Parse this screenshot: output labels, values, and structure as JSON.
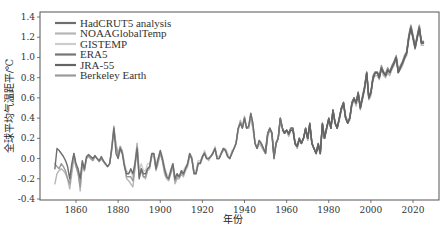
{
  "chart_data": {
    "type": "line",
    "title": "",
    "xlabel": "年份",
    "ylabel": "全球平均气温距平/℃",
    "xlim": [
      1843,
      2029
    ],
    "ylim": [
      -0.4,
      1.4
    ],
    "xticks": [
      1860,
      1880,
      1900,
      1920,
      1940,
      1960,
      1980,
      2000,
      2020
    ],
    "yticks": [
      -0.4,
      -0.2,
      0.0,
      0.2,
      0.4,
      0.6,
      0.8,
      1.0,
      1.2,
      1.4
    ],
    "ytick_labels": [
      "-0.4",
      "-0.2",
      "0.0",
      "0.2",
      "0.4",
      "0.6",
      "0.8",
      "1.0",
      "1.2",
      "1.4"
    ],
    "grid": false,
    "legend_position": "top-left",
    "series": [
      {
        "name": "HadCRUT5 analysis",
        "color": "#6e6e6e",
        "start_year": 1850,
        "values": [
          -0.1,
          0.1,
          0.08,
          0.05,
          0.02,
          -0.02,
          -0.08,
          -0.2,
          -0.05,
          0.05,
          -0.05,
          -0.1,
          -0.2,
          -0.02,
          -0.1,
          0.02,
          0.04,
          0.02,
          0.0,
          0.03,
          0.0,
          -0.02,
          0.02,
          -0.02,
          -0.05,
          -0.08,
          -0.05,
          0.1,
          0.3,
          0.05,
          0.0,
          0.1,
          0.05,
          -0.08,
          -0.15,
          -0.15,
          -0.1,
          -0.15,
          -0.05,
          0.1,
          -0.2,
          -0.1,
          -0.15,
          -0.15,
          -0.1,
          -0.08,
          0.05,
          0.05,
          -0.1,
          0.0,
          0.08,
          0.0,
          -0.1,
          -0.18,
          -0.2,
          -0.12,
          -0.05,
          -0.2,
          -0.15,
          -0.18,
          -0.12,
          -0.15,
          -0.1,
          -0.05,
          0.05,
          0.0,
          -0.15,
          -0.15,
          -0.05,
          -0.05,
          0.02,
          0.05,
          0.0,
          0.0,
          0.02,
          0.05,
          0.1,
          0.0,
          0.0,
          0.05,
          0.1,
          0.08,
          0.02,
          0.0,
          0.05,
          0.1,
          0.15,
          0.3,
          0.35,
          0.3,
          0.4,
          0.3,
          0.32,
          0.45,
          0.35,
          0.15,
          0.1,
          0.18,
          0.15,
          0.1,
          0.05,
          0.25,
          0.3,
          0.25,
          0.0,
          0.15,
          0.2,
          0.4,
          0.3,
          0.25,
          0.28,
          0.25,
          0.3,
          0.3,
          0.15,
          0.12,
          0.2,
          0.15,
          0.2,
          0.3,
          0.2,
          0.35,
          0.15,
          0.1,
          0.05,
          0.15,
          0.05,
          0.35,
          0.2,
          0.3,
          0.4,
          0.3,
          0.48,
          0.35,
          0.3,
          0.4,
          0.5,
          0.55,
          0.4,
          0.35,
          0.4,
          0.55,
          0.6,
          0.55,
          0.65,
          0.5,
          0.6,
          0.7,
          0.85,
          0.6,
          0.65,
          0.8,
          0.85,
          0.85,
          0.8,
          0.9,
          0.85,
          0.82,
          0.88,
          0.85,
          0.9,
          0.95,
          1.0,
          0.85,
          0.9,
          0.95,
          1.0,
          1.05,
          1.2,
          1.3,
          1.2,
          1.1,
          1.2,
          1.3,
          1.15,
          1.15
        ]
      },
      {
        "name": "NOAAGlobalTemp",
        "color": "#b5b5b5",
        "start_year": 1850,
        "values": [
          -0.25,
          -0.15,
          -0.12,
          -0.1,
          -0.12,
          -0.15,
          -0.2,
          -0.3,
          -0.15,
          0.0,
          -0.08,
          -0.12,
          -0.32,
          -0.05,
          -0.12,
          0.0,
          0.02,
          0.0,
          -0.02,
          0.02,
          0.0,
          -0.03,
          0.0,
          -0.03,
          -0.05,
          -0.08,
          -0.05,
          0.08,
          0.28,
          0.15,
          0.05,
          0.12,
          0.08,
          -0.05,
          -0.2,
          -0.22,
          -0.25,
          -0.28,
          -0.1,
          0.15,
          -0.15,
          -0.1,
          -0.18,
          -0.2,
          -0.12,
          -0.1,
          0.02,
          0.02,
          -0.12,
          -0.05,
          0.05,
          -0.02,
          -0.15,
          -0.2,
          -0.22,
          -0.15,
          -0.08,
          -0.25,
          -0.2,
          -0.2,
          -0.15,
          -0.18,
          -0.12,
          -0.08,
          0.02,
          0.0,
          -0.15,
          -0.15,
          -0.05,
          -0.05,
          0.0,
          0.05,
          0.0,
          -0.02,
          0.02,
          0.05,
          0.1,
          0.0,
          0.0,
          0.05,
          0.08,
          0.08,
          0.02,
          0.0,
          0.05,
          0.1,
          0.15,
          0.28,
          0.38,
          0.32,
          0.42,
          0.3,
          0.3,
          0.4,
          0.3,
          0.15,
          0.1,
          0.15,
          0.12,
          0.08,
          0.05,
          0.22,
          0.28,
          0.25,
          0.0,
          0.15,
          0.2,
          0.38,
          0.3,
          0.25,
          0.28,
          0.22,
          0.28,
          0.28,
          0.15,
          0.1,
          0.18,
          0.15,
          0.2,
          0.28,
          0.18,
          0.32,
          0.15,
          0.1,
          0.05,
          0.12,
          0.05,
          0.32,
          0.2,
          0.28,
          0.38,
          0.3,
          0.45,
          0.35,
          0.3,
          0.38,
          0.48,
          0.52,
          0.4,
          0.35,
          0.38,
          0.52,
          0.58,
          0.52,
          0.62,
          0.48,
          0.58,
          0.68,
          0.82,
          0.58,
          0.62,
          0.78,
          0.82,
          0.82,
          0.78,
          0.88,
          0.82,
          0.8,
          0.85,
          0.82,
          0.88,
          0.92,
          0.98,
          0.85,
          0.88,
          0.92,
          0.98,
          1.02,
          1.18,
          1.28,
          1.18,
          1.08,
          1.18,
          1.28,
          1.12,
          1.12
        ]
      },
      {
        "name": "GISTEMP",
        "color": "#cdcdcd",
        "start_year": 1880,
        "values": [
          0.0,
          0.08,
          0.05,
          -0.05,
          -0.12,
          -0.15,
          -0.12,
          -0.18,
          -0.02,
          0.15,
          -0.12,
          -0.05,
          -0.12,
          -0.12,
          -0.05,
          -0.05,
          0.05,
          0.05,
          -0.05,
          0.0,
          0.08,
          0.02,
          -0.08,
          -0.15,
          -0.18,
          -0.1,
          -0.05,
          -0.18,
          -0.15,
          -0.18,
          -0.12,
          -0.12,
          -0.08,
          -0.05,
          0.05,
          0.02,
          -0.12,
          -0.12,
          -0.02,
          -0.02,
          0.02,
          0.08,
          0.02,
          0.0,
          0.02,
          0.05,
          0.12,
          0.02,
          0.02,
          0.05,
          0.1,
          0.1,
          0.05,
          0.0,
          0.08,
          0.1,
          0.15,
          0.28,
          0.35,
          0.3,
          0.38,
          0.3,
          0.3,
          0.4,
          0.3,
          0.15,
          0.1,
          0.15,
          0.12,
          0.08,
          0.05,
          0.22,
          0.28,
          0.25,
          0.02,
          0.15,
          0.2,
          0.38,
          0.3,
          0.25,
          0.28,
          0.22,
          0.28,
          0.28,
          0.15,
          0.1,
          0.18,
          0.15,
          0.2,
          0.28,
          0.18,
          0.32,
          0.15,
          0.1,
          0.05,
          0.12,
          0.05,
          0.32,
          0.2,
          0.3,
          0.4,
          0.32,
          0.48,
          0.35,
          0.32,
          0.4,
          0.5,
          0.55,
          0.42,
          0.38,
          0.4,
          0.55,
          0.6,
          0.55,
          0.65,
          0.52,
          0.62,
          0.72,
          0.85,
          0.62,
          0.65,
          0.8,
          0.85,
          0.85,
          0.82,
          0.9,
          0.85,
          0.82,
          0.88,
          0.85,
          0.92,
          0.95,
          1.0,
          0.88,
          0.92,
          0.95,
          1.02,
          1.05,
          1.22,
          1.32,
          1.22,
          1.1,
          1.2,
          1.3,
          1.15,
          1.15
        ]
      },
      {
        "name": "ERA5",
        "color": "#757575",
        "start_year": 1950,
        "values": [
          0.1,
          0.25,
          0.3,
          0.25,
          0.02,
          0.15,
          0.2,
          0.4,
          0.3,
          0.25,
          0.28,
          0.25,
          0.3,
          0.3,
          0.15,
          0.12,
          0.2,
          0.15,
          0.2,
          0.3,
          0.2,
          0.35,
          0.15,
          0.1,
          0.05,
          0.15,
          0.05,
          0.35,
          0.2,
          0.3,
          0.4,
          0.3,
          0.48,
          0.35,
          0.3,
          0.4,
          0.5,
          0.55,
          0.4,
          0.35,
          0.4,
          0.55,
          0.6,
          0.55,
          0.65,
          0.5,
          0.6,
          0.7,
          0.85,
          0.6,
          0.65,
          0.8,
          0.85,
          0.85,
          0.8,
          0.9,
          0.85,
          0.82,
          0.88,
          0.85,
          0.9,
          0.95,
          1.0,
          0.85,
          0.9,
          0.95,
          1.0,
          1.05,
          1.2,
          1.3,
          1.2,
          1.1,
          1.2,
          1.3,
          1.15,
          1.15
        ]
      },
      {
        "name": "JRA-55",
        "color": "#646464",
        "start_year": 1958,
        "values": [
          0.28,
          0.25,
          0.28,
          0.24,
          0.28,
          0.28,
          0.14,
          0.12,
          0.19,
          0.15,
          0.2,
          0.29,
          0.2,
          0.34,
          0.15,
          0.1,
          0.05,
          0.14,
          0.05,
          0.34,
          0.2,
          0.3,
          0.39,
          0.3,
          0.47,
          0.35,
          0.3,
          0.39,
          0.49,
          0.55,
          0.4,
          0.35,
          0.4,
          0.54,
          0.59,
          0.55,
          0.64,
          0.5,
          0.6,
          0.7,
          0.84,
          0.6,
          0.65,
          0.79,
          0.84,
          0.85,
          0.8,
          0.89,
          0.85,
          0.82,
          0.87,
          0.85,
          0.9,
          0.94,
          1.0,
          0.85,
          0.9,
          0.94,
          1.0,
          1.04,
          1.19,
          1.29,
          1.19,
          1.09,
          1.19,
          1.29,
          1.14,
          1.14
        ]
      },
      {
        "name": "Berkeley Earth",
        "color": "#9a9a9a",
        "start_year": 1850,
        "values": [
          -0.05,
          -0.08,
          -0.1,
          -0.05,
          -0.08,
          -0.12,
          -0.2,
          -0.25,
          -0.1,
          0.05,
          -0.08,
          -0.15,
          -0.28,
          -0.05,
          -0.12,
          0.0,
          0.03,
          0.0,
          -0.02,
          0.02,
          0.0,
          -0.03,
          0.0,
          -0.03,
          -0.06,
          -0.08,
          -0.05,
          0.12,
          0.32,
          0.12,
          0.02,
          0.12,
          0.06,
          -0.06,
          -0.18,
          -0.18,
          -0.18,
          -0.22,
          -0.08,
          0.12,
          -0.18,
          -0.12,
          -0.18,
          -0.18,
          -0.1,
          -0.08,
          0.04,
          0.04,
          -0.1,
          -0.02,
          0.06,
          -0.02,
          -0.12,
          -0.18,
          -0.2,
          -0.14,
          -0.06,
          -0.22,
          -0.18,
          -0.18,
          -0.14,
          -0.16,
          -0.1,
          -0.06,
          0.04,
          0.0,
          -0.14,
          -0.14,
          -0.04,
          -0.04,
          0.02,
          0.06,
          0.0,
          0.0,
          0.02,
          0.06,
          0.1,
          0.0,
          0.0,
          0.06,
          0.1,
          0.08,
          0.02,
          0.0,
          0.06,
          0.1,
          0.16,
          0.3,
          0.36,
          0.3,
          0.4,
          0.3,
          0.32,
          0.44,
          0.34,
          0.16,
          0.1,
          0.18,
          0.14,
          0.1,
          0.06,
          0.24,
          0.3,
          0.26,
          0.02,
          0.16,
          0.2,
          0.4,
          0.3,
          0.26,
          0.28,
          0.24,
          0.3,
          0.3,
          0.16,
          0.12,
          0.2,
          0.16,
          0.2,
          0.3,
          0.2,
          0.34,
          0.16,
          0.1,
          0.06,
          0.14,
          0.06,
          0.34,
          0.2,
          0.3,
          0.4,
          0.3,
          0.48,
          0.36,
          0.3,
          0.4,
          0.5,
          0.56,
          0.42,
          0.36,
          0.4,
          0.56,
          0.6,
          0.56,
          0.66,
          0.52,
          0.62,
          0.72,
          0.86,
          0.62,
          0.66,
          0.82,
          0.86,
          0.86,
          0.82,
          0.92,
          0.86,
          0.84,
          0.9,
          0.86,
          0.92,
          0.96,
          1.02,
          0.88,
          0.92,
          0.96,
          1.02,
          1.06,
          1.22,
          1.32,
          1.22,
          1.12,
          1.22,
          1.32,
          1.16,
          1.16
        ]
      }
    ]
  }
}
